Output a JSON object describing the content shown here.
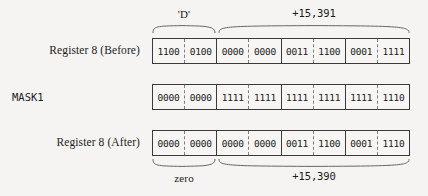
{
  "figure": {
    "colors": {
      "background": "#f5f4f2",
      "box_background": "#f7f6f4",
      "border": "#3a3a3a",
      "divider_dashed": "#7d7d7d",
      "text": "#1a1a1a"
    }
  },
  "rows": [
    {
      "label": "Register 8 (Before)",
      "label_font": "serif",
      "cells": [
        "1100",
        "0100",
        "0000",
        "0000",
        "0011",
        "1100",
        "0001",
        "1111"
      ]
    },
    {
      "label": "MASK1",
      "label_font": "mono",
      "cells": [
        "0000",
        "0000",
        "1111",
        "1111",
        "1111",
        "1111",
        "1111",
        "1110"
      ]
    },
    {
      "label": "Register 8 (After)",
      "label_font": "serif",
      "cells": [
        "0000",
        "0000",
        "0000",
        "0000",
        "0011",
        "1100",
        "0001",
        "1110"
      ]
    }
  ],
  "annotations": {
    "top": [
      {
        "name": "char-field",
        "label": "'D'",
        "spans_cells": "0-1"
      },
      {
        "name": "value-field-before",
        "label": "+15,391",
        "spans_cells": "2-7"
      }
    ],
    "bottom": [
      {
        "name": "zero-field",
        "label": "zero",
        "spans_cells": "0-1"
      },
      {
        "name": "value-field-after",
        "label": "+15,390",
        "spans_cells": "2-7"
      }
    ]
  }
}
